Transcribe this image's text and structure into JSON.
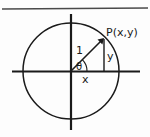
{
  "figure": {
    "kind": "unit-circle-trigonometry-diagram",
    "background_color": "#fdfdfd",
    "ink_color": "#1a1a1a",
    "top_rule_color": "#4a4a4a",
    "labels": {
      "point": "P(x,y)",
      "radius": "1",
      "angle": "θ",
      "horizontal_leg": "x",
      "vertical_leg": "y"
    },
    "geometry": {
      "center": [
        71,
        71
      ],
      "radius_px": 48,
      "point_px": [
        104,
        38
      ],
      "x_axis_y": 71,
      "y_axis_x": 71,
      "x_axis_extent": [
        12,
        140
      ],
      "y_axis_extent": [
        14,
        130
      ]
    }
  }
}
